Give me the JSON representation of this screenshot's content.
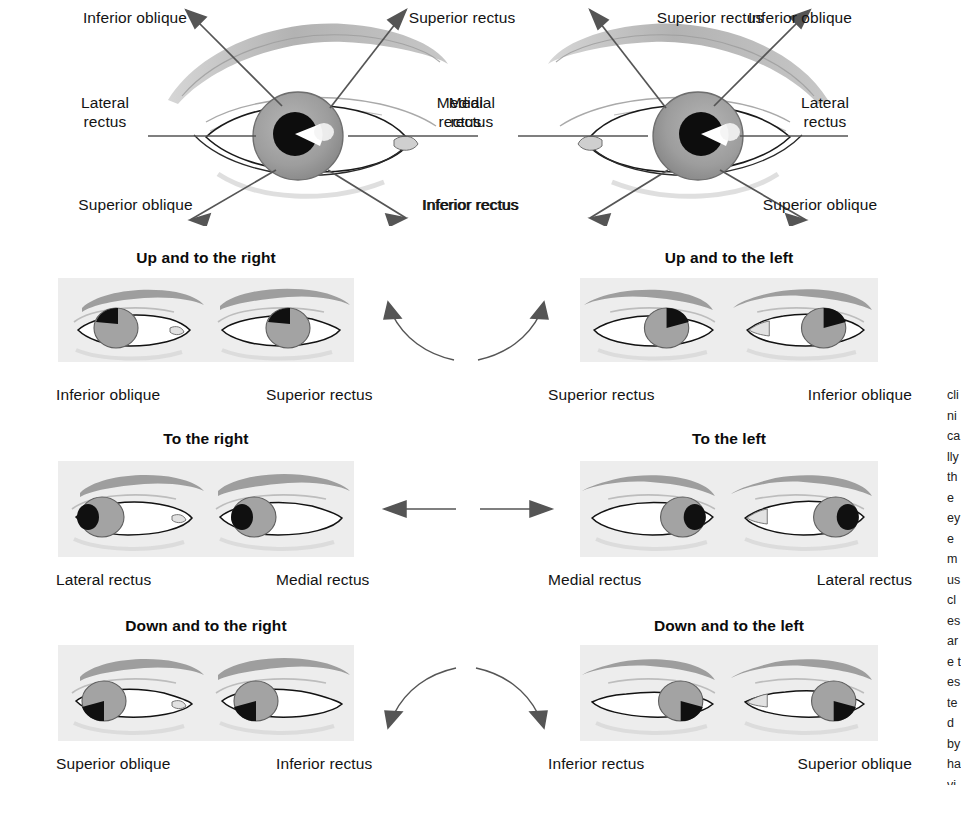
{
  "figure": {
    "title_visible": false,
    "background_color": "#ffffff",
    "panel_background": "#ededed",
    "iris_color": "#9a9a9a",
    "pupil_color": "#101010",
    "brow_color": "#8d8d8d",
    "arrow_color": "#555555"
  },
  "top_diagram": {
    "left_eye": {
      "labels": {
        "upper_left": "Inferior oblique",
        "upper_right": "Superior rectus",
        "left": "Lateral\nrectus",
        "right": "Medial\nrectus",
        "lower_left": "Superior oblique",
        "lower_right": "Inferior rectus"
      }
    },
    "right_eye": {
      "labels": {
        "upper_left": "Superior rectus",
        "upper_right": "Inferior oblique",
        "left": "Medial\nrectus",
        "right": "Lateral\nrectus",
        "lower_left": "Inferior rectus",
        "lower_right": "Superior oblique"
      }
    }
  },
  "rows": [
    {
      "id": "up",
      "connector": "arc-up",
      "left": {
        "heading": "Up and to the right",
        "labels": [
          "Inferior oblique",
          "Superior rectus"
        ],
        "gaze": "up-right"
      },
      "right": {
        "heading": "Up and to the left",
        "labels": [
          "Superior rectus",
          "Inferior oblique"
        ],
        "gaze": "up-left"
      }
    },
    {
      "id": "horizontal",
      "connector": "straight",
      "left": {
        "heading": "To the right",
        "labels": [
          "Lateral rectus",
          "Medial rectus"
        ],
        "gaze": "right"
      },
      "right": {
        "heading": "To the left",
        "labels": [
          "Medial rectus",
          "Lateral rectus"
        ],
        "gaze": "left"
      }
    },
    {
      "id": "down",
      "connector": "arc-down",
      "left": {
        "heading": "Down and to the right",
        "labels": [
          "Superior oblique",
          "Inferior rectus"
        ],
        "gaze": "down-right"
      },
      "right": {
        "heading": "Down and to the left",
        "labels": [
          "Inferior rectus",
          "Superior oblique"
        ],
        "gaze": "down-left"
      }
    }
  ],
  "edge_text": "clinically the eye muscles are tested by having the patient follow the examiner finger through the six cardinal directions of gaze"
}
